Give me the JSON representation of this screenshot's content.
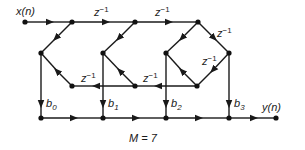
{
  "diagram": {
    "input_label": "x(n)",
    "output_label": "y(n)",
    "delay_label": "z",
    "delay_exponent": "−1",
    "coefficients": [
      {
        "base": "b",
        "sub": "0"
      },
      {
        "base": "b",
        "sub": "1"
      },
      {
        "base": "b",
        "sub": "2"
      },
      {
        "base": "b",
        "sub": "3"
      }
    ],
    "caption": "M = 7",
    "colors": {
      "line": "#1a1a1a",
      "node": "#111111",
      "background": "#ffffff"
    }
  }
}
